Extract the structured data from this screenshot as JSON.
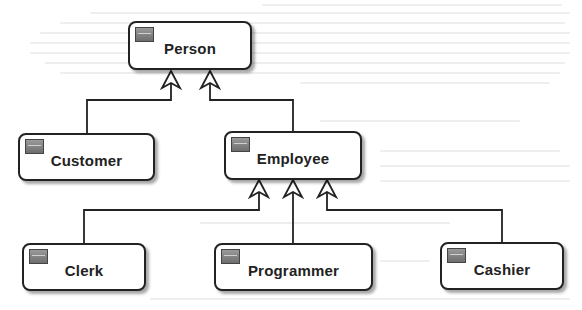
{
  "diagram": {
    "type": "uml-class-inheritance",
    "colors": {
      "border": "#222222",
      "icon_fill": "#7e7e7e",
      "background": "#ffffff"
    },
    "classes": [
      {
        "id": "person",
        "name": "Person"
      },
      {
        "id": "customer",
        "name": "Customer"
      },
      {
        "id": "employee",
        "name": "Employee"
      },
      {
        "id": "clerk",
        "name": "Clerk"
      },
      {
        "id": "programmer",
        "name": "Programmer"
      },
      {
        "id": "cashier",
        "name": "Cashier"
      }
    ],
    "generalizations": [
      {
        "child": "Customer",
        "parent": "Person"
      },
      {
        "child": "Employee",
        "parent": "Person"
      },
      {
        "child": "Clerk",
        "parent": "Employee"
      },
      {
        "child": "Programmer",
        "parent": "Employee"
      },
      {
        "child": "Cashier",
        "parent": "Employee"
      }
    ]
  }
}
